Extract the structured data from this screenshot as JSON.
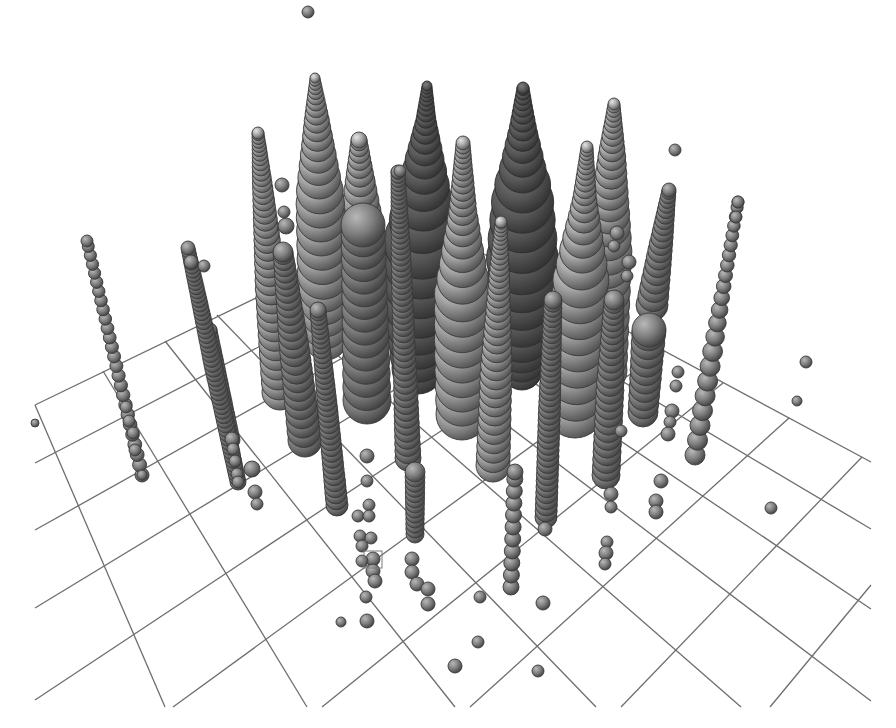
{
  "chart_data": {
    "type": "scatter",
    "subtype": "3d-sphere-stack-columns",
    "title": "",
    "xlabel": "",
    "ylabel": "",
    "zlabel": "",
    "legend": [],
    "grid": true,
    "background": "#ffffff",
    "colors": {
      "grid": "#6e6e6e",
      "sphere_light": "#d2d2d2",
      "sphere_mid": "#8c8c8c",
      "sphere_dark": "#3e3e3e",
      "ellipsoid_light": "#7a7a7a",
      "ellipsoid_dark": "#2f2f2f",
      "marker": "#7a7a7a"
    },
    "floor_grid": {
      "clip": {
        "left": 33,
        "right": 871,
        "bottom": 707
      },
      "lines_a": [
        [
          [
            35,
            405
          ],
          [
            165,
            707
          ]
        ],
        [
          [
            103,
            371
          ],
          [
            307,
            707
          ]
        ],
        [
          [
            165,
            341
          ],
          [
            455,
            707
          ]
        ],
        [
          [
            217,
            315
          ],
          [
            596,
            707
          ]
        ],
        [
          [
            265,
            292
          ],
          [
            741,
            707
          ]
        ],
        [
          [
            305,
            272
          ],
          [
            871,
            701
          ]
        ],
        [
          [
            342,
            254
          ],
          [
            871,
            609
          ]
        ],
        [
          [
            378,
            236
          ],
          [
            871,
            529
          ]
        ],
        [
          [
            415,
            217
          ],
          [
            871,
            462
          ]
        ]
      ],
      "lines_b": [
        [
          [
            417,
            220
          ],
          [
            35,
            405
          ]
        ],
        [
          [
            459,
            243
          ],
          [
            35,
            463
          ]
        ],
        [
          [
            505,
            267
          ],
          [
            35,
            530
          ]
        ],
        [
          [
            554,
            293
          ],
          [
            35,
            608
          ]
        ],
        [
          [
            607,
            321
          ],
          [
            35,
            700
          ]
        ],
        [
          [
            662,
            351
          ],
          [
            173,
            707
          ]
        ],
        [
          [
            723,
            383
          ],
          [
            322,
            707
          ]
        ],
        [
          [
            789,
            418
          ],
          [
            470,
            707
          ]
        ],
        [
          [
            862,
            457
          ],
          [
            621,
            707
          ]
        ],
        [
          [
            871,
            585
          ],
          [
            770,
            707
          ]
        ]
      ]
    },
    "columns": [
      {
        "name": "dark-ellipsoid-left",
        "x0": 427,
        "y0": 86,
        "x1": 418,
        "y1": 368,
        "profile": [
          [
            0,
            5
          ],
          [
            0.12,
            10
          ],
          [
            0.3,
            22
          ],
          [
            0.55,
            38
          ],
          [
            0.8,
            36
          ],
          [
            1,
            26
          ]
        ],
        "shade": "dark"
      },
      {
        "name": "dark-ellipsoid-right",
        "x0": 523,
        "y0": 88,
        "x1": 522,
        "y1": 370,
        "profile": [
          [
            0,
            6
          ],
          [
            0.15,
            14
          ],
          [
            0.33,
            26
          ],
          [
            0.36,
            30
          ],
          [
            0.6,
            36
          ],
          [
            0.85,
            32
          ],
          [
            1,
            20
          ]
        ],
        "shade": "dark"
      },
      {
        "name": "cone-316",
        "x0": 315,
        "y0": 78,
        "x1": 326,
        "y1": 338,
        "profile": [
          [
            0,
            5
          ],
          [
            0.15,
            12
          ],
          [
            0.45,
            24
          ],
          [
            0.75,
            26
          ],
          [
            1,
            22
          ]
        ],
        "shade": "light"
      },
      {
        "name": "cone-608",
        "x0": 614,
        "y0": 104,
        "x1": 603,
        "y1": 370,
        "profile": [
          [
            0,
            6
          ],
          [
            0.2,
            14
          ],
          [
            0.55,
            24
          ],
          [
            1,
            24
          ]
        ],
        "shade": "light"
      },
      {
        "name": "cone-262",
        "x0": 258,
        "y0": 133,
        "x1": 280,
        "y1": 392,
        "profile": [
          [
            0,
            6
          ],
          [
            0.2,
            10
          ],
          [
            0.6,
            16
          ],
          [
            1,
            18
          ]
        ],
        "shade": "light"
      },
      {
        "name": "stack-360-top",
        "x0": 359,
        "y0": 140,
        "x1": 361,
        "y1": 212,
        "profile": [
          [
            0,
            8
          ],
          [
            0.5,
            14
          ],
          [
            1,
            20
          ]
        ],
        "shade": "light"
      },
      {
        "name": "stack-360-body",
        "x0": 363,
        "y0": 225,
        "x1": 367,
        "y1": 400,
        "profile": [
          [
            0,
            22
          ],
          [
            1,
            24
          ]
        ],
        "shade": "mid"
      },
      {
        "name": "dark-col-404",
        "x0": 398,
        "y0": 172,
        "x1": 408,
        "y1": 458,
        "profile": [
          [
            0,
            7
          ],
          [
            0.3,
            10
          ],
          [
            1,
            13
          ]
        ],
        "shade": "mid"
      },
      {
        "name": "cone-462",
        "x0": 463,
        "y0": 143,
        "x1": 462,
        "y1": 414,
        "profile": [
          [
            0,
            7
          ],
          [
            0.25,
            14
          ],
          [
            0.55,
            28
          ],
          [
            0.75,
            28
          ],
          [
            1,
            26
          ]
        ],
        "shade": "light"
      },
      {
        "name": "cone-580",
        "x0": 587,
        "y0": 147,
        "x1": 575,
        "y1": 408,
        "profile": [
          [
            0,
            6
          ],
          [
            0.2,
            12
          ],
          [
            0.5,
            28
          ],
          [
            1,
            30
          ]
        ],
        "shade": "light"
      },
      {
        "name": "cone-665",
        "x0": 669,
        "y0": 190,
        "x1": 652,
        "y1": 305,
        "profile": [
          [
            0,
            7
          ],
          [
            0.5,
            12
          ],
          [
            1,
            16
          ]
        ],
        "shade": "mid"
      },
      {
        "name": "col-282",
        "x0": 283,
        "y0": 252,
        "x1": 305,
        "y1": 440,
        "profile": [
          [
            0,
            10
          ],
          [
            0.5,
            15
          ],
          [
            1,
            17
          ]
        ],
        "shade": "mid"
      },
      {
        "name": "col-325",
        "x0": 318,
        "y0": 310,
        "x1": 337,
        "y1": 505,
        "profile": [
          [
            0,
            8
          ],
          [
            0.5,
            10
          ],
          [
            1,
            11
          ]
        ],
        "shade": "mid"
      },
      {
        "name": "col-496",
        "x0": 501,
        "y0": 222,
        "x1": 493,
        "y1": 465,
        "profile": [
          [
            0,
            6
          ],
          [
            0.2,
            10
          ],
          [
            0.6,
            16
          ],
          [
            1,
            17
          ]
        ],
        "shade": "light"
      },
      {
        "name": "col-548",
        "x0": 553,
        "y0": 300,
        "x1": 546,
        "y1": 517,
        "profile": [
          [
            0,
            9
          ],
          [
            0.5,
            11
          ],
          [
            1,
            11
          ]
        ],
        "shade": "mid"
      },
      {
        "name": "col-606",
        "x0": 614,
        "y0": 300,
        "x1": 606,
        "y1": 475,
        "profile": [
          [
            0,
            10
          ],
          [
            0.5,
            14
          ],
          [
            1,
            14
          ]
        ],
        "shade": "mid"
      },
      {
        "name": "col-645",
        "x0": 649,
        "y0": 330,
        "x1": 643,
        "y1": 412,
        "profile": [
          [
            0,
            17
          ],
          [
            1,
            15
          ]
        ],
        "shade": "mid"
      },
      {
        "name": "col-716",
        "x0": 738,
        "y0": 202,
        "x1": 695,
        "y1": 455,
        "profile": [
          [
            0,
            6
          ],
          [
            0.3,
            7
          ],
          [
            0.6,
            10
          ],
          [
            1,
            10
          ]
        ],
        "shade": "mid",
        "gap": true
      },
      {
        "name": "col-left-120",
        "x0": 87,
        "y0": 241,
        "x1": 142,
        "y1": 475,
        "profile": [
          [
            0,
            6
          ],
          [
            1,
            7
          ]
        ],
        "shade": "mid",
        "gap": true
      },
      {
        "name": "col-left-215",
        "x0": 188,
        "y0": 248,
        "x1": 238,
        "y1": 482,
        "profile": [
          [
            0,
            7
          ],
          [
            0.5,
            9
          ],
          [
            1,
            8
          ]
        ],
        "shade": "mid"
      },
      {
        "name": "col-left-225b",
        "x0": 210,
        "y0": 330,
        "x1": 232,
        "y1": 440,
        "profile": [
          [
            0,
            7
          ],
          [
            1,
            8
          ]
        ],
        "shade": "mid"
      },
      {
        "name": "col-415-low",
        "x0": 415,
        "y0": 472,
        "x1": 415,
        "y1": 534,
        "profile": [
          [
            0,
            10
          ],
          [
            1,
            9
          ]
        ],
        "shade": "mid"
      },
      {
        "name": "col-513-low",
        "x0": 515,
        "y0": 472,
        "x1": 511,
        "y1": 587,
        "profile": [
          [
            0,
            8
          ],
          [
            1,
            8
          ]
        ],
        "shade": "mid",
        "gap": true
      }
    ],
    "spheres": [
      {
        "x": 308,
        "y": 12,
        "r": 6
      },
      {
        "x": 675,
        "y": 150,
        "r": 6
      },
      {
        "x": 282,
        "y": 185,
        "r": 7
      },
      {
        "x": 284,
        "y": 212,
        "r": 6
      },
      {
        "x": 286,
        "y": 226,
        "r": 8
      },
      {
        "x": 400,
        "y": 171,
        "r": 6
      },
      {
        "x": 738,
        "y": 202,
        "r": 6
      },
      {
        "x": 736,
        "y": 217,
        "r": 6
      },
      {
        "x": 806,
        "y": 362,
        "r": 6
      },
      {
        "x": 797,
        "y": 401,
        "r": 5
      },
      {
        "x": 771,
        "y": 508,
        "r": 6
      },
      {
        "x": 629,
        "y": 262,
        "r": 7
      },
      {
        "x": 627,
        "y": 276,
        "r": 6
      },
      {
        "x": 621,
        "y": 431,
        "r": 6
      },
      {
        "x": 678,
        "y": 372,
        "r": 6
      },
      {
        "x": 676,
        "y": 386,
        "r": 6
      },
      {
        "x": 672,
        "y": 411,
        "r": 7
      },
      {
        "x": 670,
        "y": 422,
        "r": 6
      },
      {
        "x": 668,
        "y": 434,
        "r": 7
      },
      {
        "x": 611,
        "y": 494,
        "r": 7
      },
      {
        "x": 611,
        "y": 507,
        "r": 6
      },
      {
        "x": 661,
        "y": 481,
        "r": 7
      },
      {
        "x": 656,
        "y": 501,
        "r": 7
      },
      {
        "x": 656,
        "y": 512,
        "r": 7
      },
      {
        "x": 607,
        "y": 542,
        "r": 6
      },
      {
        "x": 606,
        "y": 553,
        "r": 7
      },
      {
        "x": 605,
        "y": 564,
        "r": 6
      },
      {
        "x": 252,
        "y": 469,
        "r": 8
      },
      {
        "x": 255,
        "y": 492,
        "r": 7
      },
      {
        "x": 257,
        "y": 504,
        "r": 6
      },
      {
        "x": 204,
        "y": 266,
        "r": 6
      },
      {
        "x": 191,
        "y": 262,
        "r": 7
      },
      {
        "x": 367,
        "y": 456,
        "r": 7
      },
      {
        "x": 367,
        "y": 481,
        "r": 6
      },
      {
        "x": 369,
        "y": 505,
        "r": 6
      },
      {
        "x": 358,
        "y": 516,
        "r": 6
      },
      {
        "x": 369,
        "y": 516,
        "r": 6
      },
      {
        "x": 360,
        "y": 536,
        "r": 6
      },
      {
        "x": 371,
        "y": 538,
        "r": 6
      },
      {
        "x": 362,
        "y": 546,
        "r": 6
      },
      {
        "x": 362,
        "y": 561,
        "r": 6
      },
      {
        "x": 373,
        "y": 559,
        "r": 7
      },
      {
        "x": 373,
        "y": 571,
        "r": 7
      },
      {
        "x": 375,
        "y": 581,
        "r": 7
      },
      {
        "x": 366,
        "y": 597,
        "r": 6
      },
      {
        "x": 367,
        "y": 621,
        "r": 7
      },
      {
        "x": 341,
        "y": 622,
        "r": 5
      },
      {
        "x": 412,
        "y": 559,
        "r": 7
      },
      {
        "x": 412,
        "y": 572,
        "r": 7
      },
      {
        "x": 417,
        "y": 584,
        "r": 7
      },
      {
        "x": 428,
        "y": 589,
        "r": 7
      },
      {
        "x": 428,
        "y": 604,
        "r": 7
      },
      {
        "x": 480,
        "y": 597,
        "r": 6
      },
      {
        "x": 543,
        "y": 603,
        "r": 7
      },
      {
        "x": 478,
        "y": 642,
        "r": 6
      },
      {
        "x": 455,
        "y": 666,
        "r": 7
      },
      {
        "x": 538,
        "y": 671,
        "r": 6
      },
      {
        "x": 545,
        "y": 529,
        "r": 7
      },
      {
        "x": 35,
        "y": 423,
        "r": 4
      },
      {
        "x": 126,
        "y": 407,
        "r": 6
      },
      {
        "x": 129,
        "y": 421,
        "r": 6
      },
      {
        "x": 133,
        "y": 433,
        "r": 6
      },
      {
        "x": 135,
        "y": 450,
        "r": 6
      },
      {
        "x": 142,
        "y": 475,
        "r": 5
      },
      {
        "x": 232,
        "y": 439,
        "r": 7
      },
      {
        "x": 233,
        "y": 449,
        "r": 6
      },
      {
        "x": 235,
        "y": 461,
        "r": 6
      },
      {
        "x": 237,
        "y": 474,
        "r": 6
      },
      {
        "x": 238,
        "y": 482,
        "r": 6
      },
      {
        "x": 617,
        "y": 233,
        "r": 7
      },
      {
        "x": 614,
        "y": 246,
        "r": 6
      }
    ],
    "markers": [
      {
        "type": "box",
        "x": 364,
        "y": 551,
        "w": 18,
        "h": 17
      }
    ]
  }
}
